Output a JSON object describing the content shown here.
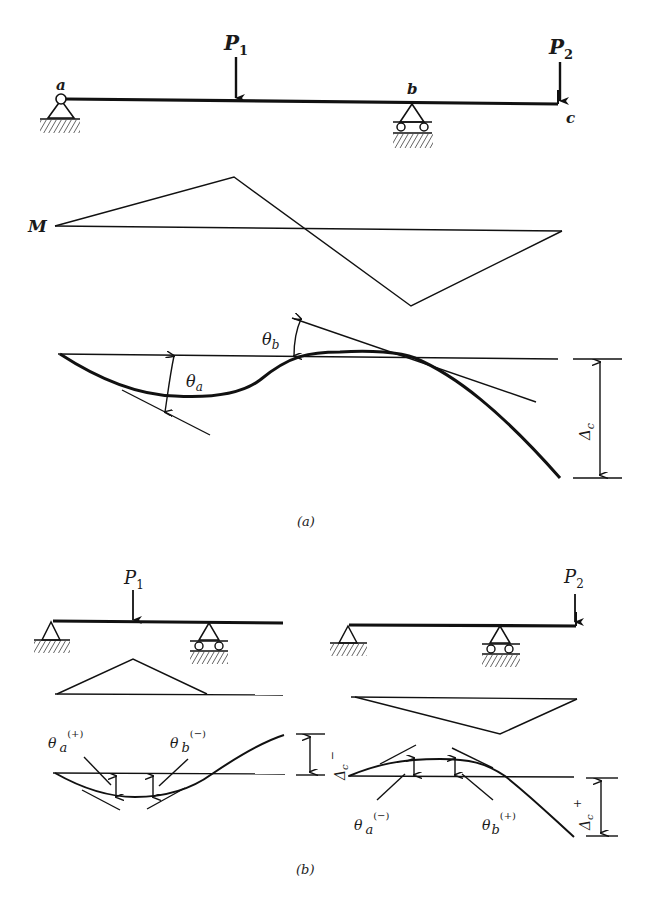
{
  "figure": {
    "part_a": {
      "caption": "(a)",
      "beam": {
        "support_a_label": "a",
        "support_b_label": "b",
        "end_c_label": "c",
        "load_1": {
          "symbol": "P",
          "subscript": "1"
        },
        "load_2": {
          "symbol": "P",
          "subscript": "2"
        }
      },
      "moment_diagram": {
        "label": "M"
      },
      "deflection": {
        "theta_a": {
          "symbol": "θ",
          "subscript": "a"
        },
        "theta_b": {
          "symbol": "θ",
          "subscript": "b"
        },
        "delta_c": {
          "symbol": "Δ",
          "subscript": "c"
        }
      }
    },
    "part_b": {
      "caption": "(b)",
      "left": {
        "load": {
          "symbol": "P",
          "subscript": "1"
        },
        "theta_a": {
          "symbol": "θ",
          "subscript": "a",
          "sign": "(+)"
        },
        "theta_b": {
          "symbol": "θ",
          "subscript": "b",
          "sign": "(−)"
        },
        "delta_c": {
          "symbol": "Δ",
          "subscript": "c",
          "sign": "−"
        }
      },
      "right": {
        "load": {
          "symbol": "P",
          "subscript": "2"
        },
        "theta_a": {
          "symbol": "θ",
          "subscript": "a",
          "sign": "(−)"
        },
        "theta_b": {
          "symbol": "θ",
          "subscript": "b",
          "sign": "(+)"
        },
        "delta_c": {
          "symbol": "Δ",
          "subscript": "c",
          "sign": "+"
        }
      }
    }
  },
  "colors": {
    "ink": "#111111",
    "background": "#ffffff"
  }
}
